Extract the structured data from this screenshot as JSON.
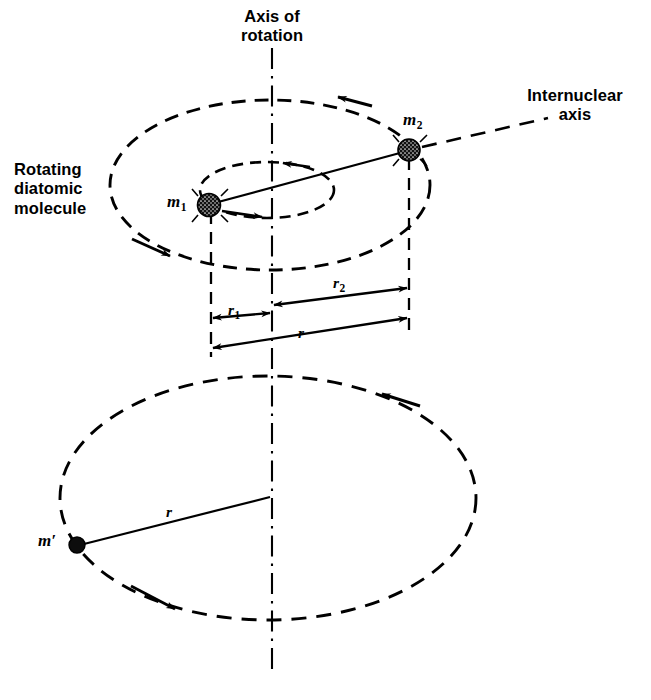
{
  "figure": {
    "background_color": "#ffffff",
    "stroke_color": "#000000",
    "width": 651,
    "height": 700
  },
  "labels": {
    "axis_of_rotation": "Axis of\nrotation",
    "internuclear_axis": "Internuclear\naxis",
    "rotating_diatomic_molecule": "Rotating\ndiatomic\nmolecule",
    "mass_1": "m",
    "mass_1_sub": "1",
    "mass_2": "m",
    "mass_2_sub": "2",
    "mass_prime": "m′",
    "radius_1": "r",
    "radius_1_sub": "1",
    "radius_2": "r",
    "radius_2_sub": "2",
    "radius_total": "r",
    "radius_lower": "r"
  },
  "chart_data": {
    "type": "diagram",
    "axis_of_rotation": {
      "x": 272,
      "y_top": 48,
      "y_bottom": 676,
      "style": "dash-dot vertical line"
    },
    "upper_system": {
      "m2_orbit": {
        "center_x": 270,
        "center_y": 185,
        "rx": 160,
        "ry": 85,
        "style": "dashed ellipse",
        "rotation_sense": "counterclockwise viewed from above"
      },
      "m1_orbit": {
        "center_x": 267,
        "center_y": 190,
        "rx": 67,
        "ry": 28,
        "style": "dashed ellipse",
        "rotation_sense": "counterclockwise viewed from above"
      },
      "m1_position": {
        "x": 209,
        "y": 205
      },
      "m2_position": {
        "x": 409,
        "y": 150
      },
      "internuclear_line": {
        "from": [
          209,
          205
        ],
        "to": [
          409,
          150
        ],
        "style": "solid"
      },
      "internuclear_axis_extension": {
        "from": [
          420,
          147
        ],
        "to": [
          548,
          118
        ],
        "style": "dashed"
      }
    },
    "dimension_lines": [
      {
        "name": "r1",
        "from_x": 211,
        "to_x": 272,
        "y_from": 318,
        "y_to": 313,
        "arrows": "both",
        "label": "r1",
        "meaning": "distance from m1 to rotation axis"
      },
      {
        "name": "r2",
        "from_x": 272,
        "to_x": 409,
        "y_from": 305,
        "y_to": 288,
        "arrows": "both",
        "label": "r2",
        "meaning": "distance from m2 to rotation axis"
      },
      {
        "name": "r",
        "from_x": 211,
        "to_x": 409,
        "y_from": 348,
        "y_to": 318,
        "arrows": "both",
        "label": "r",
        "meaning": "internuclear separation r = r1 + r2"
      }
    ],
    "lower_system": {
      "orbit": {
        "center_x": 268,
        "center_y": 498,
        "rx": 208,
        "ry": 122,
        "style": "dashed ellipse",
        "rotation_sense": "counterclockwise viewed from above"
      },
      "mass_position": {
        "x": 77,
        "y": 545,
        "label": "m′"
      },
      "radius_line": {
        "from": [
          77,
          545
        ],
        "to": [
          270,
          497
        ],
        "style": "solid",
        "label": "r"
      }
    }
  },
  "label_positions": {
    "axis_of_rotation": {
      "x": 227,
      "y": 8
    },
    "internuclear_axis": {
      "x": 523,
      "y": 88
    },
    "rotating_diatomic_molecule": {
      "x": 14,
      "y": 163
    },
    "mass_1": {
      "x": 168,
      "y": 195
    },
    "mass_2": {
      "x": 404,
      "y": 112
    },
    "mass_prime": {
      "x": 38,
      "y": 533
    },
    "radius_1": {
      "x": 228,
      "y": 303
    },
    "radius_2": {
      "x": 333,
      "y": 276
    },
    "radius_total": {
      "x": 297,
      "y": 326
    },
    "radius_lower": {
      "x": 165,
      "y": 504
    }
  }
}
